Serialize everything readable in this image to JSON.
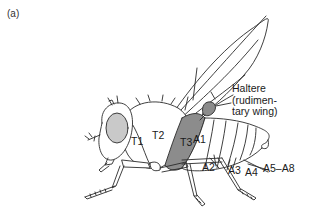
{
  "figure": {
    "panel_label": "(a)",
    "labels": {
      "haltere_line1": "Haltere",
      "haltere_line2": "(rudimen-",
      "haltere_line3": "tary wing)",
      "t1": "T1",
      "t2": "T2",
      "t3": "T3",
      "a1": "A1",
      "a2": "A2",
      "a3": "A3",
      "a4": "A4",
      "a5_a8": "A5–A8"
    },
    "colors": {
      "line": "#2a2a2a",
      "shaded_segment": "#8c8c8c",
      "eye_fill": "#c9c9c9",
      "background": "#ffffff"
    }
  }
}
